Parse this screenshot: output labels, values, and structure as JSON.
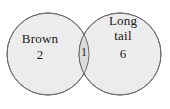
{
  "diagram": {
    "type": "venn",
    "background_color": "#ffffff",
    "circle_fill_color": "#ececec",
    "intersection_fill_color": "#dcdcdc",
    "stroke_color": "#6b6b6b",
    "text_color": "#1a1a1a",
    "sets": [
      {
        "id": "left",
        "label": "Brown",
        "label_lines": [
          "Brown"
        ],
        "count": "2",
        "cx": 48,
        "cy": 54,
        "r": 41
      },
      {
        "id": "right",
        "label": "Long tail",
        "label_lines": [
          "Long",
          "tail"
        ],
        "count": "6",
        "cx": 120,
        "cy": 54,
        "r": 41
      }
    ],
    "intersection": {
      "label": "",
      "count": "1"
    }
  }
}
